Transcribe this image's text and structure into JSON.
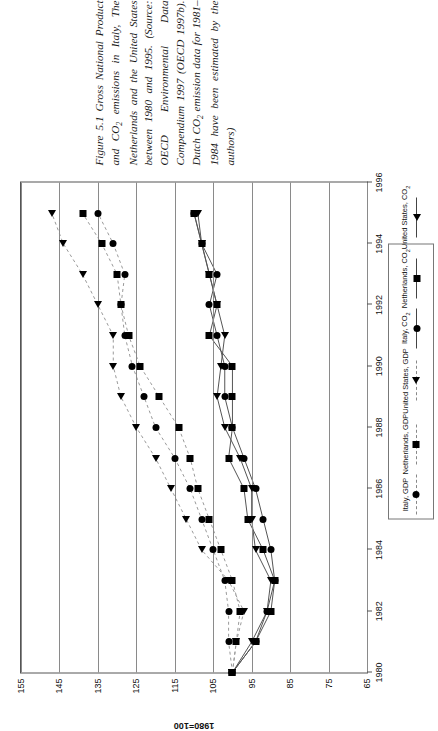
{
  "figure": {
    "caption_line1": "Figure 5.1 Gross National Product and CO",
    "caption_sub1": "2",
    "caption_line2": " emissions in Italy, The Netherlands and the United States between 1980 and 1995. (Source: OECD Environmental Data Compendium 1997 (OECD 1997b). Dutch CO",
    "caption_sub2": "2",
    "caption_line3": " emission data for 1981–1984 have been estimated by the authors)"
  },
  "chart_data": {
    "type": "line",
    "title": "",
    "xlabel": "year",
    "ylabel": "1980=100",
    "xlim": [
      1980,
      1996
    ],
    "ylim": [
      65,
      155
    ],
    "xticks": [
      1980,
      1982,
      1984,
      1986,
      1988,
      1990,
      1992,
      1994,
      1996
    ],
    "xtick_labels": [
      "1980",
      "1982",
      "1984",
      "1986",
      "1988",
      "1990",
      "1992",
      "1994",
      "1996"
    ],
    "yticks": [
      65,
      75,
      85,
      95,
      105,
      115,
      125,
      135,
      145,
      155
    ],
    "ytick_labels": [
      "65",
      "75",
      "85",
      "95",
      "105",
      "115",
      "125",
      "135",
      "145",
      "155"
    ],
    "grid": "horizontal-gridlines-at-yticks",
    "legend_position": "below-plot-right",
    "x": [
      1980,
      1981,
      1982,
      1983,
      1984,
      1985,
      1986,
      1987,
      1988,
      1989,
      1990,
      1991,
      1992,
      1993,
      1994,
      1995
    ],
    "series": [
      {
        "name": "Italy, GDP",
        "marker": "circle",
        "line": "dashed",
        "color": "#000000",
        "values": [
          100,
          101,
          101,
          102,
          105,
          108,
          111,
          115,
          120,
          123,
          126,
          128,
          129,
          128,
          131,
          135
        ]
      },
      {
        "name": "Netherlands, GDP",
        "marker": "square",
        "line": "dashed",
        "color": "#000000",
        "values": [
          100,
          99,
          98,
          100,
          103,
          106,
          109,
          111,
          114,
          119,
          124,
          127,
          129,
          130,
          134,
          139
        ]
      },
      {
        "name": "United States, GDP",
        "marker": "triangle",
        "line": "dashed",
        "color": "#000000",
        "values": [
          100,
          99,
          97,
          101,
          108,
          112,
          116,
          120,
          125,
          129,
          131,
          131,
          135,
          139,
          144,
          147
        ]
      },
      {
        "name": "Italy, CO2",
        "marker": "circle",
        "line": "solid",
        "color": "#000000",
        "values": [
          100,
          94,
          91,
          89,
          90,
          92,
          94,
          97,
          100,
          102,
          102,
          104,
          106,
          104,
          108,
          110
        ]
      },
      {
        "name": "Netherlands, CO2",
        "marker": "square",
        "line": "solid",
        "color": "#000000",
        "values": [
          100,
          94,
          90,
          89,
          92,
          96,
          97,
          101,
          100,
          100,
          100,
          106,
          104,
          106,
          108,
          110
        ]
      },
      {
        "name": "United States, CO2",
        "marker": "triangle",
        "line": "solid",
        "color": "#000000",
        "values": [
          100,
          95,
          91,
          90,
          94,
          95,
          95,
          98,
          102,
          104,
          103,
          102,
          104,
          106,
          108,
          109
        ]
      }
    ]
  },
  "legend": {
    "items": [
      {
        "label_main": "Italy, GDP",
        "sub": "",
        "label_tail": "",
        "marker": "circle",
        "line": "dash"
      },
      {
        "label_main": "Netherlands, GDP",
        "sub": "",
        "label_tail": "",
        "marker": "square",
        "line": "dash"
      },
      {
        "label_main": "United States, GDP",
        "sub": "",
        "label_tail": "",
        "marker": "triangle",
        "line": "dash"
      },
      {
        "label_main": "Italy, CO",
        "sub": "2",
        "label_tail": "",
        "marker": "circle",
        "line": "solid"
      },
      {
        "label_main": "Netherlands, CO",
        "sub": "2",
        "label_tail": "",
        "marker": "square",
        "line": "solid"
      },
      {
        "label_main": "United States, CO",
        "sub": "2",
        "label_tail": "",
        "marker": "triangle",
        "line": "solid"
      }
    ]
  }
}
